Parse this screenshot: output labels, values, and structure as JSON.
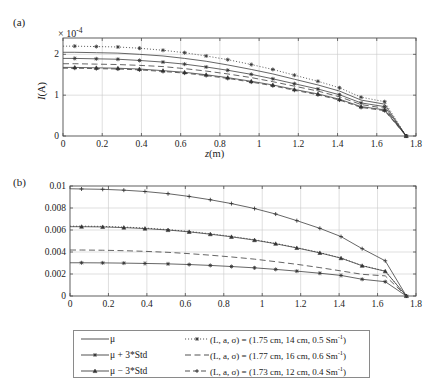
{
  "figure": {
    "panel_a_label": "(a)",
    "panel_b_label": "(b)",
    "exponent_annotation_prefix": "× 10",
    "exponent_annotation_exp": "-4"
  },
  "legend": {
    "rows": [
      {
        "left_label": "μ",
        "left_style": "solid",
        "left_marker": "none",
        "right_label": "(L, a, σ) = (1.75 cm, 14 cm, 0.5 Sm",
        "right_label_sup": "-1",
        "right_label_tail": ")",
        "right_style": "dotted",
        "right_marker": "star"
      },
      {
        "left_label": "μ + 3*Std",
        "left_style": "solid",
        "left_marker": "star",
        "right_label": "(L, a, σ) = (1.77 cm, 16 cm, 0.6 Sm",
        "right_label_sup": "-1",
        "right_label_tail": ")",
        "right_style": "dashed",
        "right_marker": "none"
      },
      {
        "left_label": "μ − 3*Std",
        "left_style": "solid",
        "left_marker": "triangle",
        "right_label": "(L, a, σ) = (1.73 cm, 12 cm, 0.4 Sm",
        "right_label_sup": "-1",
        "right_label_tail": ")",
        "right_style": "dashplus",
        "right_marker": "plus"
      }
    ]
  },
  "chart_data": [
    {
      "type": "line",
      "panel": "a",
      "title": "",
      "xlabel": "z(m)",
      "ylabel": "I(A)",
      "y_scale_label": "× 10^-4",
      "xlim": [
        0,
        1.8
      ],
      "ylim": [
        0,
        2.4
      ],
      "xticks": [
        0,
        0.2,
        0.4,
        0.6,
        0.8,
        1,
        1.2,
        1.4,
        1.6,
        1.8
      ],
      "xticklabels": [
        "0",
        "0.2",
        "0.4",
        "0.6",
        "0.8",
        "1",
        "1.2",
        "1.4",
        "1.6",
        "1.8"
      ],
      "yticks": [
        0,
        1,
        2
      ],
      "yticklabels": [
        "0",
        "1",
        "2"
      ],
      "grid": true,
      "x": [
        0,
        0.06,
        0.17,
        0.28,
        0.39,
        0.51,
        0.62,
        0.73,
        0.84,
        0.96,
        1.07,
        1.18,
        1.3,
        1.41,
        1.52,
        1.64,
        1.75
      ],
      "series": [
        {
          "name": "mu",
          "style": "solid",
          "marker": "none",
          "values": [
            2.05,
            2.05,
            2.04,
            2.03,
            2.0,
            1.96,
            1.9,
            1.83,
            1.74,
            1.63,
            1.52,
            1.39,
            1.25,
            1.1,
            0.88,
            0.78,
            0.0
          ]
        },
        {
          "name": "mu + 3*Std",
          "style": "solid",
          "marker": "star",
          "values": [
            1.9,
            1.9,
            1.89,
            1.88,
            1.85,
            1.81,
            1.76,
            1.69,
            1.61,
            1.51,
            1.4,
            1.28,
            1.15,
            1.01,
            0.81,
            0.72,
            0.0
          ]
        },
        {
          "name": "mu - 3*Std",
          "style": "solid",
          "marker": "triangle",
          "values": [
            1.68,
            1.68,
            1.67,
            1.66,
            1.64,
            1.6,
            1.56,
            1.5,
            1.43,
            1.34,
            1.25,
            1.14,
            1.03,
            0.9,
            0.72,
            0.64,
            0.0
          ]
        },
        {
          "name": "(L, a, sigma) = (1.75 cm, 14 cm, 0.5 Sm-1)",
          "style": "dotted",
          "marker": "star",
          "values": [
            2.2,
            2.2,
            2.19,
            2.18,
            2.15,
            2.1,
            2.04,
            1.96,
            1.87,
            1.75,
            1.63,
            1.49,
            1.34,
            1.18,
            0.95,
            0.84,
            0.0
          ]
        },
        {
          "name": "(L, a, sigma) = (1.77 cm, 16 cm, 0.6 Sm-1)",
          "style": "dashed",
          "marker": "none",
          "values": [
            1.77,
            1.77,
            1.76,
            1.75,
            1.73,
            1.7,
            1.65,
            1.59,
            1.52,
            1.43,
            1.33,
            1.22,
            1.1,
            0.96,
            0.77,
            0.68,
            0.0
          ]
        },
        {
          "name": "(L, a, sigma) = (1.73 cm, 12 cm, 0.4 Sm-1)",
          "style": "dashplus",
          "marker": "plus",
          "values": [
            1.66,
            1.66,
            1.65,
            1.64,
            1.62,
            1.58,
            1.54,
            1.48,
            1.41,
            1.32,
            1.23,
            1.12,
            1.01,
            0.88,
            0.7,
            0.62,
            0.0
          ]
        }
      ]
    },
    {
      "type": "line",
      "panel": "b",
      "title": "",
      "xlabel": "z(m)",
      "ylabel": "E^ind(V/m)",
      "xlim": [
        0,
        1.8
      ],
      "ylim": [
        0,
        0.01
      ],
      "xticks": [
        0,
        0.2,
        0.4,
        0.6,
        0.8,
        1,
        1.2,
        1.4,
        1.6,
        1.8
      ],
      "xticklabels": [
        "0",
        "0.2",
        "0.4",
        "0.6",
        "0.8",
        "1",
        "1.2",
        "1.4",
        "1.6",
        "1.8"
      ],
      "yticks": [
        0,
        0.002,
        0.004,
        0.006,
        0.008,
        0.01
      ],
      "yticklabels": [
        "0",
        "0.002",
        "0.004",
        "0.006",
        "0.008",
        "0.01"
      ],
      "grid": true,
      "x": [
        0,
        0.06,
        0.17,
        0.28,
        0.39,
        0.51,
        0.62,
        0.73,
        0.84,
        0.96,
        1.07,
        1.18,
        1.3,
        1.41,
        1.52,
        1.64,
        1.75
      ],
      "series": [
        {
          "name": "(L, a, sigma) = (1.73 cm, 12 cm, 0.4 Sm-1)",
          "style": "solid",
          "marker": "plus",
          "values": [
            0.00975,
            0.00973,
            0.0097,
            0.00962,
            0.0095,
            0.0093,
            0.00905,
            0.00875,
            0.0084,
            0.00795,
            0.00745,
            0.00685,
            0.00615,
            0.0054,
            0.0043,
            0.0032,
            0.0
          ]
        },
        {
          "name": "mu + 3*Std",
          "style": "solid",
          "marker": "triangle",
          "values": [
            0.0063,
            0.0063,
            0.00628,
            0.00622,
            0.00613,
            0.006,
            0.00583,
            0.00562,
            0.00538,
            0.00508,
            0.00475,
            0.00437,
            0.00392,
            0.00344,
            0.00275,
            0.00225,
            0.0
          ]
        },
        {
          "name": "(L, a, sigma) = (1.75 cm, 14 cm, 0.5 Sm-1)",
          "style": "dotted",
          "marker": "none",
          "values": [
            0.00635,
            0.00635,
            0.00633,
            0.00627,
            0.00618,
            0.00604,
            0.00587,
            0.00566,
            0.00542,
            0.00512,
            0.00478,
            0.0044,
            0.00395,
            0.00346,
            0.00277,
            0.00227,
            0.0
          ]
        },
        {
          "name": "(L, a, sigma) = (1.77 cm, 16 cm, 0.6 Sm-1)",
          "style": "dashed",
          "marker": "none",
          "values": [
            0.00418,
            0.00418,
            0.00416,
            0.00412,
            0.00406,
            0.00397,
            0.00385,
            0.00371,
            0.00355,
            0.00335,
            0.00312,
            0.00288,
            0.00258,
            0.00228,
            0.00197,
            0.00183,
            0.0
          ]
        },
        {
          "name": "mu",
          "style": "solid",
          "marker": "star",
          "values": [
            0.00302,
            0.00302,
            0.00301,
            0.00299,
            0.00296,
            0.00292,
            0.00286,
            0.00278,
            0.00268,
            0.00256,
            0.00242,
            0.00226,
            0.00207,
            0.00187,
            0.00152,
            0.0013,
            0.0
          ]
        }
      ]
    }
  ]
}
